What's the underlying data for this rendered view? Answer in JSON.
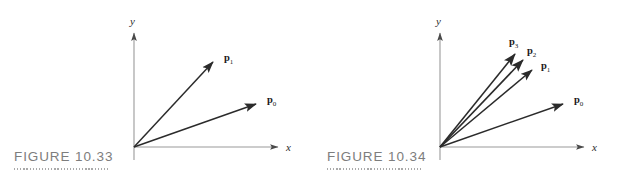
{
  "document": {
    "background_color": "#ffffff",
    "ink_color": "#2b2b2b",
    "caption_color": "#7d7d7d",
    "axis_color": "#9a9a9a"
  },
  "figures": [
    {
      "id": "figure-10-33",
      "caption": "FIGURE 10.33",
      "axes": {
        "x_label": "x",
        "y_label": "y",
        "origin": {
          "x": 134,
          "y": 147
        },
        "x_end": {
          "x": 284,
          "y": 147
        },
        "y_end": {
          "x": 134,
          "y": 27
        }
      },
      "vectors": [
        {
          "label": "p",
          "subscript": "1",
          "tip": {
            "x": 216,
            "y": 59
          },
          "label_pos": {
            "x": 224,
            "y": 58
          }
        },
        {
          "label": "p",
          "subscript": "0",
          "tip": {
            "x": 259,
            "y": 101
          },
          "label_pos": {
            "x": 267,
            "y": 100
          }
        }
      ]
    },
    {
      "id": "figure-10-34",
      "caption": "FIGURE 10.34",
      "axes": {
        "x_label": "x",
        "y_label": "y",
        "origin": {
          "x": 127,
          "y": 147
        },
        "x_end": {
          "x": 277,
          "y": 147
        },
        "y_end": {
          "x": 127,
          "y": 27
        }
      },
      "vectors": [
        {
          "label": "p",
          "subscript": "3",
          "tip": {
            "x": 205,
            "y": 51
          },
          "label_pos": {
            "x": 198,
            "y": 42
          }
        },
        {
          "label": "p",
          "subscript": "2",
          "tip": {
            "x": 213,
            "y": 57
          },
          "label_pos": {
            "x": 216,
            "y": 50
          }
        },
        {
          "label": "p",
          "subscript": "1",
          "tip": {
            "x": 222,
            "y": 67
          },
          "label_pos": {
            "x": 229,
            "y": 66
          }
        },
        {
          "label": "p",
          "subscript": "0",
          "tip": {
            "x": 253,
            "y": 101
          },
          "label_pos": {
            "x": 261,
            "y": 100
          }
        }
      ]
    }
  ]
}
